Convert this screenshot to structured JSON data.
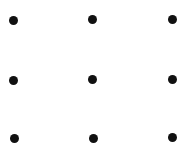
{
  "diagram": {
    "type": "dot-grid",
    "rows": 3,
    "cols": 3,
    "dot_color": "#111111",
    "background": "#ffffff",
    "dots": [
      {
        "row": 1,
        "col": 1,
        "x": 13,
        "y": 20
      },
      {
        "row": 1,
        "col": 2,
        "x": 92,
        "y": 19
      },
      {
        "row": 1,
        "col": 3,
        "x": 172,
        "y": 19
      },
      {
        "row": 2,
        "col": 1,
        "x": 13,
        "y": 80
      },
      {
        "row": 2,
        "col": 2,
        "x": 92,
        "y": 79
      },
      {
        "row": 2,
        "col": 3,
        "x": 172,
        "y": 79
      },
      {
        "row": 3,
        "col": 1,
        "x": 14,
        "y": 138
      },
      {
        "row": 3,
        "col": 2,
        "x": 93,
        "y": 138
      },
      {
        "row": 3,
        "col": 3,
        "x": 172,
        "y": 137
      }
    ]
  }
}
